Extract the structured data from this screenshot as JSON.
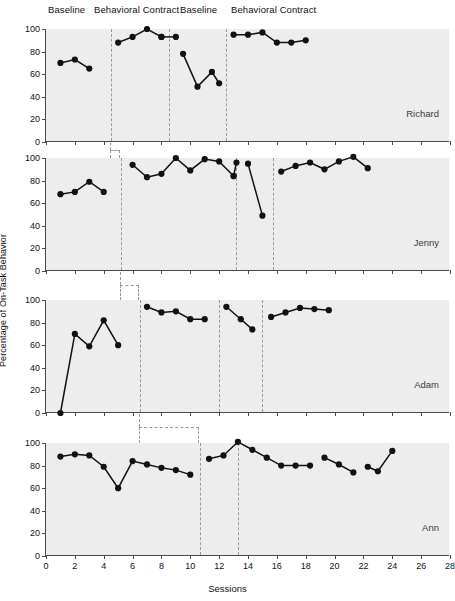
{
  "chart_data": {
    "type": "line",
    "title": "",
    "xlabel": "Sessions",
    "ylabel": "Percentage of On-Task Behavior",
    "xlim": [
      0,
      28
    ],
    "ylim": [
      0,
      100
    ],
    "xticks": [
      0,
      2,
      4,
      6,
      8,
      10,
      12,
      14,
      16,
      18,
      20,
      22,
      24,
      26,
      28
    ],
    "yticks": [
      0,
      20,
      40,
      60,
      80,
      100
    ],
    "grid": false,
    "legend_position": "none",
    "design": "multiple-baseline ABAB withdrawal design",
    "phase_labels": [
      {
        "text": "Baseline",
        "at_x": 2.3
      },
      {
        "text": "Behavioral Contract",
        "at_x": 6.6
      },
      {
        "text": "Behavioral Contract",
        "at_x": 16.2
      },
      {
        "text": "Baseline",
        "at_x": 11.7
      }
    ],
    "panels": [
      {
        "name": "Richard",
        "phase_lines": [
          4.5,
          8.5,
          12.5
        ],
        "series": [
          {
            "name": "Baseline",
            "x": [
              1,
              2,
              3
            ],
            "values": [
              70,
              73,
              65
            ]
          },
          {
            "name": "Behavioral Contract",
            "x": [
              5,
              6,
              7,
              8
            ],
            "values": [
              88,
              93,
              100,
              93
            ]
          },
          {
            "name": "Behavioral Contract cont",
            "x": [
              8,
              9
            ],
            "values": [
              93,
              93
            ]
          },
          {
            "name": "Baseline 2",
            "x": [
              9.5,
              10.5,
              11.5,
              12
            ],
            "values": [
              78,
              49,
              62,
              52
            ]
          },
          {
            "name": "Behavioral Contract 2",
            "x": [
              13,
              14,
              15,
              16,
              17,
              18
            ],
            "values": [
              95,
              95,
              97,
              88,
              88,
              90
            ]
          }
        ]
      },
      {
        "name": "Jenny",
        "phase_lines": [
          5.2,
          13.2,
          15.7
        ],
        "series": [
          {
            "name": "Baseline",
            "x": [
              1,
              2,
              3,
              4
            ],
            "values": [
              68,
              70,
              79,
              70
            ]
          },
          {
            "name": "Behavioral Contract",
            "x": [
              6,
              7,
              8,
              9,
              10,
              11,
              12,
              13
            ],
            "values": [
              94,
              83,
              86,
              100,
              89,
              99,
              97,
              84
            ]
          },
          {
            "name": "Behavioral Contract end",
            "x": [
              13,
              13.2
            ],
            "values": [
              84,
              96
            ]
          },
          {
            "name": "Baseline 2",
            "x": [
              14,
              15
            ],
            "values": [
              95,
              49
            ]
          },
          {
            "name": "Behavioral Contract 2",
            "x": [
              16.3,
              17.3,
              18.3,
              19.3,
              20.3,
              21.3,
              22.3
            ],
            "values": [
              88,
              93,
              96,
              90,
              97,
              101,
              91
            ]
          }
        ]
      },
      {
        "name": "Adam",
        "phase_lines": [
          6.5,
          12.0,
          15.0
        ],
        "series": [
          {
            "name": "Baseline",
            "x": [
              1,
              2,
              3,
              4,
              5
            ],
            "values": [
              0,
              70,
              59,
              82,
              60
            ]
          },
          {
            "name": "Behavioral Contract",
            "x": [
              7,
              8,
              9,
              10,
              11
            ],
            "values": [
              94,
              89,
              90,
              83,
              83
            ]
          },
          {
            "name": "Baseline 2",
            "x": [
              12.5,
              13.5,
              14.3
            ],
            "values": [
              94,
              83,
              74
            ]
          },
          {
            "name": "Behavioral Contract 2",
            "x": [
              15.6,
              16.6,
              17.6,
              18.6,
              19.6
            ],
            "values": [
              85,
              89,
              93,
              92,
              91
            ]
          }
        ]
      },
      {
        "name": "Ann",
        "phase_lines": [
          10.7,
          13.3
        ],
        "series": [
          {
            "name": "Baseline",
            "x": [
              1,
              2,
              3,
              4,
              5,
              6,
              7,
              8,
              9,
              10
            ],
            "values": [
              88,
              90,
              89,
              79,
              60,
              84,
              81,
              78,
              76,
              72
            ]
          },
          {
            "name": "Behavioral Contract",
            "x": [
              11.3,
              12.3,
              13.3,
              14.3,
              15.3,
              16.3,
              17.3,
              18.3
            ],
            "values": [
              86,
              89,
              101,
              94,
              87,
              80,
              80,
              80
            ]
          },
          {
            "name": "Baseline 2",
            "x": [
              19.3,
              20.3,
              21.3
            ],
            "values": [
              87,
              81,
              74
            ]
          },
          {
            "name": "Behavioral Contract 2",
            "x": [
              22.3,
              23.0,
              24.0
            ],
            "values": [
              79,
              75,
              93
            ]
          }
        ]
      }
    ]
  },
  "axis": {
    "ylabel": "Percentage of On-Task Behavior",
    "xlabel": "Sessions",
    "ytick_labels": [
      "100",
      "80",
      "60",
      "40",
      "20",
      "0"
    ],
    "xtick_labels": [
      "0",
      "2",
      "4",
      "6",
      "8",
      "10",
      "12",
      "14",
      "16",
      "18",
      "20",
      "22",
      "24",
      "26",
      "28"
    ]
  },
  "phase_headers": [
    {
      "label": "Baseline"
    },
    {
      "label": "Behavioral Contract"
    },
    {
      "label": "Baseline"
    },
    {
      "label": "Behavioral Contract"
    }
  ],
  "panel_names": [
    "Richard",
    "Jenny",
    "Adam",
    "Ann"
  ],
  "colors": {
    "plot_background": "#ededed",
    "axis": "#4a4a4a",
    "data": "#111111",
    "phase_line": "#9a9a9a",
    "page_background": "#ffffff"
  }
}
